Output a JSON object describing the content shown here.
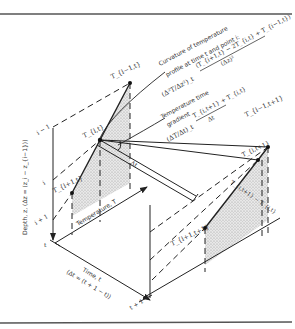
{
  "figure": {
    "axes": {
      "depth_label": "Depth, z, (Δz = (z_i − z_{i−1}))",
      "temperature_label": "Temperature, T",
      "time_label": "Time, t",
      "time_sublabel": "(Δt = (t + 1 − t))"
    },
    "depth_ticks": [
      "i − 1",
      "i",
      "i + 1"
    ],
    "time_ticks": [
      "t",
      "t + 1"
    ],
    "points": {
      "t_im1_t": "T_{i−1,t}",
      "t_i_t": "T_{i,t}",
      "t_ip1_t": "T_{i+1,t}",
      "t_im1_tp1": "T_{i−1,t+1}",
      "t_i_tp1": "T_{i,t+1}",
      "t_ip1_tp1": "T_{i+1,t+1}"
    },
    "annotations": {
      "curvature_title_line1": "Curvature of temperature",
      "curvature_title_line2": "profile at time t and point i:",
      "curvature_lhs": "(Δ²T/Δz²)_t",
      "curvature_numerator": "(T_{i+1,t} − 2T_{i,t} + T_{i−1,t})",
      "curvature_denominator": "(Δz)²",
      "gradient_title_line1": "Temperature time",
      "gradient_title_line2": "gradient",
      "gradient_lhs": "(ΔT/Δt)_t",
      "gradient_numerator": "T_{i,t+1} + T_{i,t}",
      "gradient_denominator": "Δt",
      "delta_t_label": "Δt",
      "diff_label": "T_{i,t+1} − T_{i,t}"
    }
  }
}
